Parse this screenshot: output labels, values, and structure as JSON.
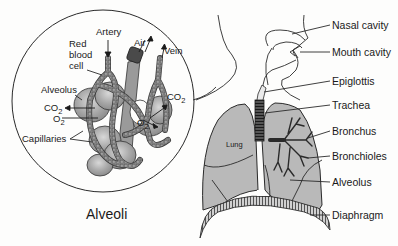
{
  "inset": {
    "title": "Alveoli",
    "labels": {
      "artery": "Artery",
      "red_blood_cell_1": "Red",
      "red_blood_cell_2": "blood",
      "red_blood_cell_3": "cell",
      "air": "Air",
      "vein": "Vein",
      "alveolus": "Alveolus",
      "co2_left": "CO",
      "co2_left_sub": "2",
      "o2_left": "O",
      "o2_left_sub": "2",
      "co2_right": "CO",
      "co2_right_sub": "2",
      "o2_right": "O",
      "o2_right_sub": "2",
      "capillaries": "Capillaries"
    }
  },
  "main": {
    "lung_label": "Lung",
    "labels": {
      "nasal_cavity": "Nasal cavity",
      "mouth_cavity": "Mouth cavity",
      "epiglottis": "Epiglottis",
      "trachea": "Trachea",
      "bronchus": "Bronchus",
      "bronchioles": "Bronchioles",
      "alveolus": "Alveolus",
      "diaphragm": "Diaphragm"
    }
  },
  "colors": {
    "lung_fill": "#b9b9b9",
    "alveolus_fill": "#a9a9a9",
    "capillary_fill": "#8a8a8a",
    "dark": "#3a3a3a",
    "background": "#fdfdfc",
    "line": "#2a2a2a"
  }
}
